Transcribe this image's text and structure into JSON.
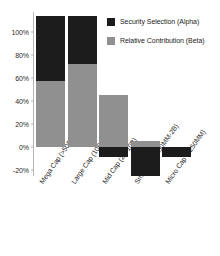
{
  "chart_data": {
    "type": "bar",
    "stacked": true,
    "title": "",
    "subtitle": "",
    "xlabel": "",
    "ylabel": "",
    "categories": [
      "Mega Cap (>50B)",
      "Large Cap (10B-50B)",
      "Mid Cap (2B-10B)",
      "Small Cap (250MM-2B)",
      "Micro Cap (<250MM)"
    ],
    "series": [
      {
        "name": "Security Selection (Alpha)",
        "color": "#1c1c1c",
        "values": [
          57,
          42,
          -9,
          -25,
          -9
        ]
      },
      {
        "name": "Relative Contribution (Beta)",
        "color": "#909090",
        "values": [
          57,
          72,
          45,
          5,
          0
        ]
      }
    ],
    "bar_totals": [
      114,
      114,
      45,
      5,
      -9
    ],
    "ylim": [
      -28,
      118
    ],
    "yticks": [
      -20,
      0,
      20,
      40,
      60,
      80,
      100
    ],
    "ytick_labels": [
      "-20%",
      "0%",
      "20%",
      "40%",
      "60%",
      "80%",
      "100%"
    ],
    "grid": false,
    "legend_position": "top-right",
    "legend_entries": [
      {
        "label": "Security Selection (Alpha)",
        "color": "#1c1c1c",
        "swatch": "alpha-swatch"
      },
      {
        "label": "Relative Contribution (Beta)",
        "color": "#909090",
        "swatch": "beta-swatch"
      }
    ],
    "bars": [
      {
        "category": "Mega Cap (>50B)",
        "beta_from": 0,
        "beta_to": 57,
        "alpha_from": 57,
        "alpha_to": 114
      },
      {
        "category": "Large Cap (10B-50B)",
        "beta_from": 0,
        "beta_to": 72,
        "alpha_from": 72,
        "alpha_to": 114
      },
      {
        "category": "Mid Cap (2B-10B)",
        "beta_from": 0,
        "beta_to": 45,
        "alpha_from": -9,
        "alpha_to": 0
      },
      {
        "category": "Small Cap (250MM-2B)",
        "beta_from": 0,
        "beta_to": 5,
        "alpha_from": -25,
        "alpha_to": 0
      },
      {
        "category": "Micro Cap (<250MM)",
        "beta_from": 0,
        "beta_to": 0,
        "alpha_from": -9,
        "alpha_to": 0
      }
    ]
  }
}
